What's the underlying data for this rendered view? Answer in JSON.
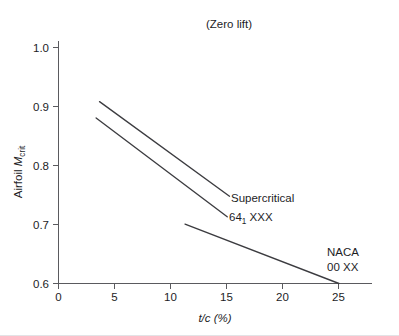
{
  "chart_data": {
    "type": "line",
    "title": "(Zero lift)",
    "xlabel": "t/c (%)",
    "ylabel": "Airfoil Mcrit",
    "ylabel_parts": {
      "main": "Airfoil ",
      "symbol": "M",
      "subscript": "crit"
    },
    "xlim": [
      0,
      27.5
    ],
    "ylim": [
      0.6,
      1.0
    ],
    "xticks": [
      0,
      5,
      10,
      15,
      20,
      25
    ],
    "xtick_labels": [
      "0",
      "5",
      "10",
      "15",
      "20",
      "25"
    ],
    "yticks": [
      0.6,
      0.7,
      0.8,
      0.9,
      1.0
    ],
    "ytick_labels": [
      "0.6",
      "0.7",
      "0.8",
      "0.9",
      "1.0"
    ],
    "grid": false,
    "legend": "inline-annotations",
    "series": [
      {
        "name": "Supercritical",
        "label": "Supercritical",
        "x": [
          3.6,
          15.0
        ],
        "y": [
          0.9,
          0.744
        ]
      },
      {
        "name": "641 XXX",
        "label": "64",
        "label_subscript": "1",
        "label_suffix": " XXX",
        "x": [
          3.3,
          14.8
        ],
        "y": [
          0.873,
          0.71
        ]
      },
      {
        "name": "NACA 00 XX",
        "label_line1": "NACA",
        "label_line2": "00 XX",
        "x": [
          11.1,
          24.6
        ],
        "y": [
          0.698,
          0.6
        ]
      }
    ],
    "annotations": [
      {
        "name": "supercritical-annotation",
        "text": "Supercritical"
      },
      {
        "name": "sixtyfour-annotation",
        "text": "64"
      },
      {
        "name": "naca-annotation-line1",
        "text": "NACA"
      },
      {
        "name": "naca-annotation-line2",
        "text": "00 XX"
      }
    ],
    "colors": {
      "line": "#3c3c40",
      "axis": "#5a5a5e",
      "text": "#1d1d1f",
      "background": "#ffffff"
    }
  }
}
